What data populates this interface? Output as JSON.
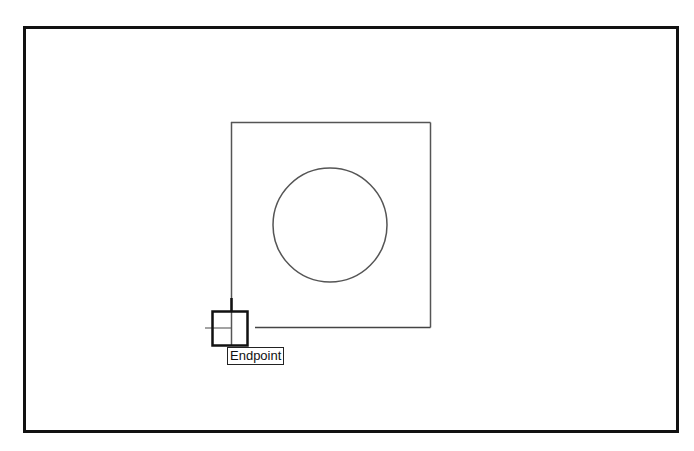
{
  "viewport": {
    "background": "#ffffff",
    "frame_color": "#111111"
  },
  "drawing": {
    "square": {
      "x1": 231,
      "y1": 122,
      "x2": 430,
      "y2": 328,
      "stroke": "#555555"
    },
    "circle": {
      "cx": 330,
      "cy": 225,
      "r": 57,
      "stroke": "#555555"
    }
  },
  "osnap": {
    "marker": "endpoint-box",
    "box": {
      "x": 212,
      "y": 311,
      "w": 35,
      "h": 35
    },
    "tooltip": {
      "label": "Endpoint"
    }
  },
  "cursor": {
    "type": "crosshair",
    "x": 231,
    "y": 328
  }
}
